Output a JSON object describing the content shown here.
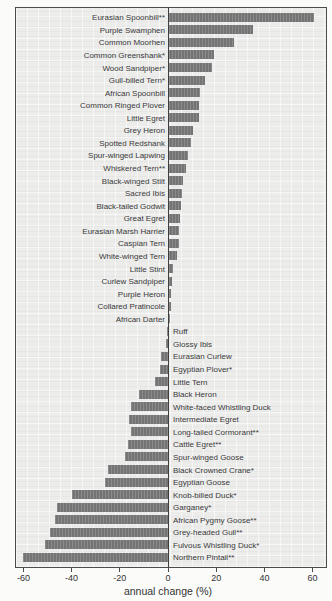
{
  "chart_data": {
    "type": "bar",
    "orientation": "horizontal",
    "title": "",
    "xlabel": "annual change (%)",
    "ylabel": "",
    "xlim": [
      -64,
      66
    ],
    "x_ticks": [
      -60,
      -40,
      -20,
      0,
      20,
      40,
      60
    ],
    "tick_labels": [
      "-60",
      "-40",
      "-20",
      "0",
      "20",
      "40",
      "60"
    ],
    "grid": "faint graph-paper texture",
    "bar_color": "#7b7b7b",
    "plot_bg": "#ececeb",
    "categories": [
      "Eurasian Spoonbill**",
      "Purple Swamphen",
      "Common Moorhen",
      "Common Greenshank*",
      "Wood Sandpiper*",
      "Gull-billed Tern*",
      "African Spoonbill",
      "Common Ringed Plover",
      "Little Egret",
      "Grey Heron",
      "Spotted Redshank",
      "Spur-winged Lapwing",
      "Whiskered Tern**",
      "Black-winged Stilt",
      "Sacred Ibis",
      "Black-tailed Godwit",
      "Great Egret",
      "Eurasian Marsh Harrier",
      "Caspian Tern",
      "White-winged Tern",
      "Little Stint",
      "Curlew Sandpiper",
      "Purple Heron",
      "Collared Pratincole",
      "African Darter",
      "Ruff",
      "Glossy Ibis",
      "Eurasian Curlew",
      "Egyptian Plover*",
      "Little Tern",
      "Black Heron",
      "White-faced Whistling Duck",
      "Intermediate Egret",
      "Long-tailed Cormorant**",
      "Cattle Egret**",
      "Spur-winged Goose",
      "Black Crowned Crane*",
      "Egyptian Goose",
      "Knob-billed Duck*",
      "Garganey*",
      "African Pygmy Goose**",
      "Grey-headed Gull**",
      "Fulvous Whistling Duck*",
      "Northern Pintail**"
    ],
    "values": [
      60,
      35,
      27,
      18.5,
      18,
      15,
      13,
      12.5,
      12.5,
      10,
      9,
      8,
      7,
      6,
      5.5,
      5,
      4.5,
      4,
      4,
      3.5,
      1.5,
      1.2,
      1,
      0.8,
      0.5,
      -0.3,
      -0.8,
      -3,
      -3.5,
      -5.5,
      -12,
      -15.5,
      -16,
      -15.5,
      -16.5,
      -18,
      -25,
      -26,
      -40,
      -46,
      -47,
      -49,
      -51,
      -60
    ]
  }
}
